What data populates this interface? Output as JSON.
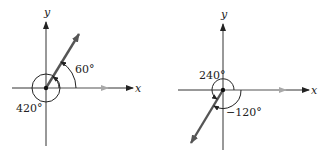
{
  "diagrams": [
    {
      "id": "left",
      "x_axis_label": "x",
      "y_axis_label": "y",
      "angle_labels": [
        "60°",
        "420°"
      ],
      "terminal_side_angle_deg": 60,
      "coterminal_angle_deg": 420
    },
    {
      "id": "right",
      "x_axis_label": "x",
      "y_axis_label": "y",
      "angle_labels": [
        "240°",
        "−120°"
      ],
      "terminal_side_angle_deg": 240,
      "coterminal_angle_deg": -120
    }
  ],
  "colors": {
    "axis": "#333333",
    "initial_side": "#a0a0a0",
    "terminal_side": "#555555",
    "arc": "#222222"
  }
}
